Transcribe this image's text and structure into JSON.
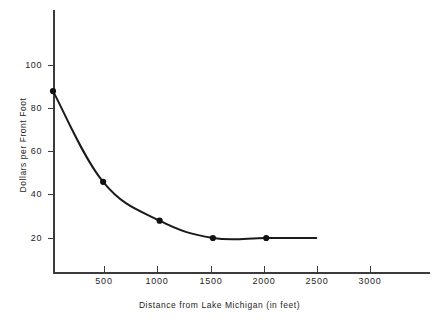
{
  "chart_data": {
    "type": "line",
    "title": "",
    "xlabel": "Distance from Lake Michigan  (in feet)",
    "ylabel": "Dollars per Front Foot",
    "xlim": [
      0,
      3200
    ],
    "ylim": [
      0,
      110
    ],
    "grid": false,
    "legend": "none",
    "x_ticks": [
      500,
      1000,
      1500,
      2000,
      2500,
      3000
    ],
    "x_tick_labels": [
      "500",
      "1000",
      "1500",
      "2000",
      "2500",
      "3000"
    ],
    "y_ticks": [
      20,
      40,
      60,
      80,
      100
    ],
    "y_tick_labels": [
      "20",
      "40",
      "60",
      "80",
      "100"
    ],
    "series": [
      {
        "name": "Land value decay",
        "marker": "filled-circle",
        "x": [
          0,
          470,
          1000,
          1500,
          2000
        ],
        "values": [
          88,
          46,
          28,
          20,
          20
        ],
        "curve_end_x": 2470,
        "curve_end_y": 20
      }
    ]
  },
  "axes": {
    "y_title": "Dollars per Front Foot",
    "x_title": "Distance from Lake Michigan  (in feet)",
    "y_labels": [
      "100",
      "80",
      "60",
      "40",
      "20"
    ],
    "x_labels": [
      "500",
      "1000",
      "1500",
      "2000",
      "2500",
      "3000"
    ]
  },
  "colors": {
    "curve": "#1a1a1a",
    "axis": "#3b3b3b",
    "marker": "#111111",
    "background": "#ffffff",
    "text": "#1e1e1e"
  }
}
